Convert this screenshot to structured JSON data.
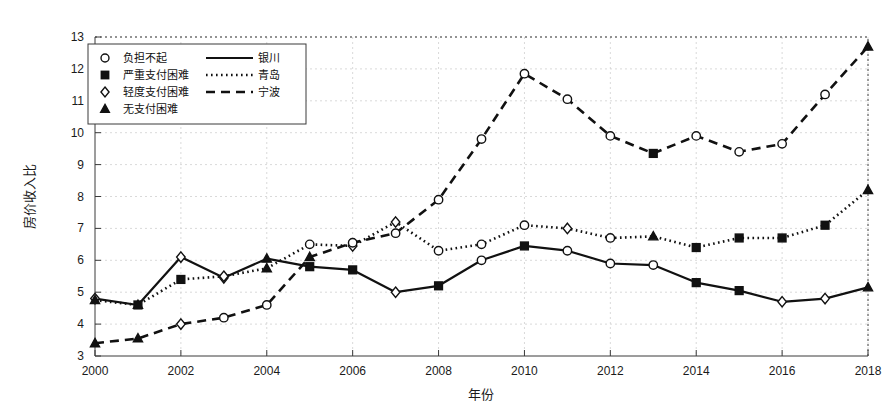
{
  "chart_data": {
    "type": "line",
    "title": "",
    "xlabel": "年份",
    "ylabel": "房价收入比",
    "x": [
      2000,
      2001,
      2002,
      2003,
      2004,
      2005,
      2006,
      2007,
      2008,
      2009,
      2010,
      2011,
      2012,
      2013,
      2014,
      2015,
      2016,
      2017,
      2018
    ],
    "xlim": [
      2000,
      2018
    ],
    "ylim": [
      3,
      13
    ],
    "xticks": [
      2000,
      2002,
      2004,
      2006,
      2008,
      2010,
      2012,
      2014,
      2016,
      2018
    ],
    "yticks": [
      3,
      4,
      5,
      6,
      7,
      8,
      9,
      10,
      11,
      12,
      13
    ],
    "grid": true,
    "legend_position": "top-left",
    "series": [
      {
        "name": "银川",
        "linestyle": "solid",
        "values": [
          4.8,
          4.6,
          6.1,
          5.45,
          6.05,
          5.8,
          5.7,
          5.0,
          5.2,
          6.0,
          6.45,
          6.3,
          5.9,
          5.85,
          5.3,
          5.05,
          4.7,
          4.8,
          5.15
        ],
        "markers": [
          "diamond",
          "triangle",
          "diamond",
          "diamond",
          "triangle",
          "square",
          "square",
          "diamond",
          "square",
          "circle",
          "square",
          "circle",
          "circle",
          "circle",
          "square",
          "square",
          "diamond",
          "diamond",
          "triangle"
        ]
      },
      {
        "name": "青岛",
        "linestyle": "dotted",
        "values": [
          4.75,
          4.6,
          5.4,
          5.5,
          5.75,
          6.5,
          6.45,
          7.2,
          6.3,
          6.5,
          7.1,
          7.0,
          6.7,
          6.75,
          6.4,
          6.7,
          6.7,
          7.1,
          8.2
        ],
        "markers": [
          "triangle",
          "square",
          "square",
          "diamond",
          "triangle",
          "circle",
          "diamond",
          "diamond",
          "circle",
          "circle",
          "circle",
          "diamond",
          "circle",
          "triangle",
          "square",
          "square",
          "square",
          "square",
          "triangle"
        ]
      },
      {
        "name": "宁波",
        "linestyle": "dashed",
        "values": [
          3.4,
          3.55,
          4.0,
          4.2,
          4.6,
          6.1,
          6.55,
          6.85,
          7.9,
          9.8,
          11.85,
          11.05,
          9.9,
          9.35,
          9.9,
          9.4,
          9.65,
          11.2,
          12.7
        ],
        "markers": [
          "triangle",
          "triangle",
          "diamond",
          "circle",
          "circle",
          "triangle",
          "circle",
          "circle",
          "circle",
          "circle",
          "circle",
          "circle",
          "circle",
          "square",
          "circle",
          "circle",
          "circle",
          "circle",
          "triangle"
        ]
      }
    ],
    "legend_markers": [
      {
        "label": "负担不起",
        "marker": "circle"
      },
      {
        "label": "严重支付困难",
        "marker": "square"
      },
      {
        "label": "轻度支付困难",
        "marker": "diamond"
      },
      {
        "label": "无支付困难",
        "marker": "triangle"
      }
    ],
    "legend_lines": [
      {
        "label": "银川",
        "linestyle": "solid"
      },
      {
        "label": "青岛",
        "linestyle": "dotted"
      },
      {
        "label": "宁波",
        "linestyle": "dashed"
      }
    ],
    "colors": {
      "line": "#111111",
      "grid": "#cfcfcf",
      "frame": "#3a3a3a",
      "background": "#ffffff"
    }
  }
}
